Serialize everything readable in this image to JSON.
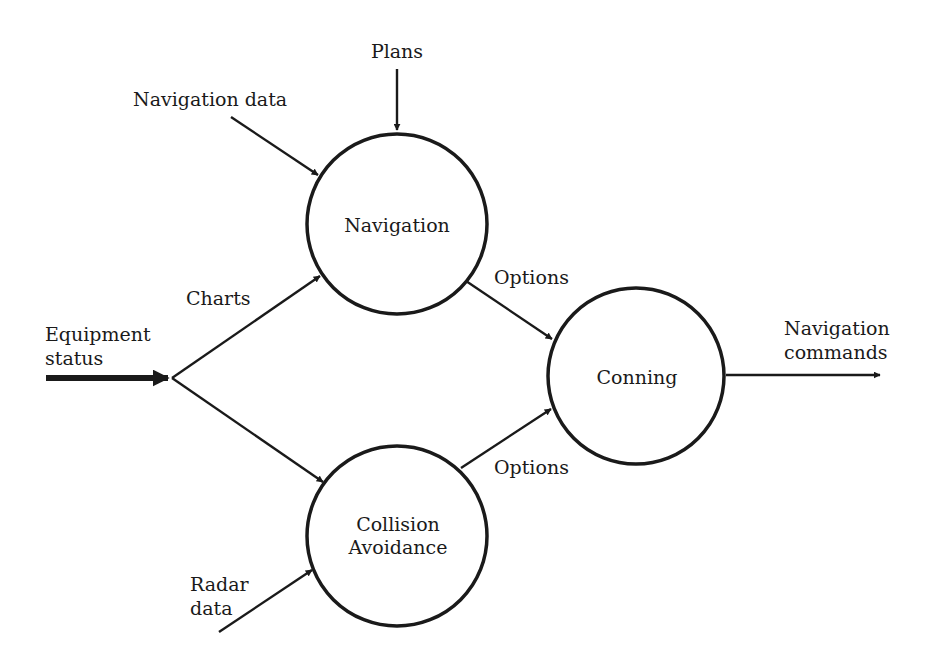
{
  "diagram": {
    "nodes": {
      "navigation": {
        "label": "Navigation"
      },
      "collision": {
        "line1": "Collision",
        "line2": "Avoidance"
      },
      "conning": {
        "label": "Conning"
      }
    },
    "inputs": {
      "plans": "Plans",
      "navigation_data": "Navigation data",
      "equipment_line1": "Equipment",
      "equipment_line2": "status",
      "radar_line1": "Radar",
      "radar_line2": "data"
    },
    "edges": {
      "charts": "Charts",
      "options_top": "Options",
      "options_bottom": "Options",
      "output_line1": "Navigation",
      "output_line2": "commands"
    },
    "colors": {
      "stroke": "#1a1a1a",
      "background": "#ffffff"
    }
  }
}
